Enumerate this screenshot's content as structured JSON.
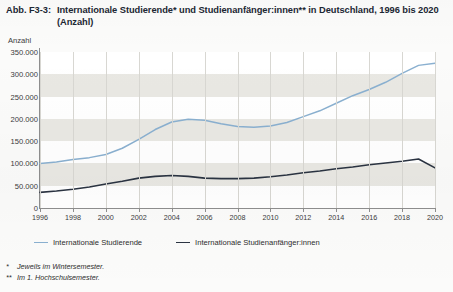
{
  "figure": {
    "number": "Abb. F3-3:",
    "title": "Internationale Studierende* und Studienanfänger:innen** in Deutschland, 1996 bis 2020 (Anzahl)"
  },
  "footnotes": [
    {
      "mark": "*",
      "text": "Jeweils im Wintersemester."
    },
    {
      "mark": "**",
      "text": "Im 1. Hochschulsemester."
    }
  ],
  "colors": {
    "series_studierende": "#8ab0d0",
    "series_anfaenger": "#2b3442",
    "band": "#e9e8e3",
    "grid": "#d8d7d2",
    "axis": "#8e8e8e",
    "title": "#1b2733"
  },
  "chart_data": {
    "type": "line",
    "title": "Internationale Studierende* und Studienanfänger:innen** in Deutschland, 1996 bis 2020 (Anzahl)",
    "xlabel": "",
    "ylabel": "Anzahl",
    "ylim": [
      0,
      350000
    ],
    "ytick_labels": [
      "0",
      "50.000",
      "100.000",
      "150.000",
      "200.000",
      "250.000",
      "300.000",
      "350.000"
    ],
    "ytick_values": [
      0,
      50000,
      100000,
      150000,
      200000,
      250000,
      300000,
      350000
    ],
    "xlim": [
      1996,
      2020
    ],
    "xtick_labels": [
      "1996",
      "1998",
      "2000",
      "2002",
      "2004",
      "2006",
      "2008",
      "2010",
      "2012",
      "2014",
      "2016",
      "2018",
      "2020"
    ],
    "xtick_values": [
      1996,
      1998,
      2000,
      2002,
      2004,
      2006,
      2008,
      2010,
      2012,
      2014,
      2016,
      2018,
      2020
    ],
    "x": [
      1996,
      1997,
      1998,
      1999,
      2000,
      2001,
      2002,
      2003,
      2004,
      2005,
      2006,
      2007,
      2008,
      2009,
      2010,
      2011,
      2012,
      2013,
      2014,
      2015,
      2016,
      2017,
      2018,
      2019,
      2020
    ],
    "grid": true,
    "legend_position": "below",
    "series": [
      {
        "name": "Internationale Studierende",
        "color": "#8ab0d0",
        "values": [
          100000,
          103000,
          109000,
          113000,
          120000,
          134000,
          154000,
          176000,
          193000,
          199000,
          197000,
          189000,
          183000,
          181000,
          184000,
          192000,
          205000,
          218000,
          235000,
          252000,
          266000,
          282000,
          302000,
          320000,
          325000
        ]
      },
      {
        "name": "Internationale Studienanfänger:innen",
        "color": "#2b3442",
        "values": [
          35000,
          38000,
          42000,
          47000,
          54000,
          60000,
          67000,
          71000,
          73000,
          71000,
          67000,
          66000,
          66000,
          67000,
          70000,
          74000,
          79000,
          83000,
          88000,
          92000,
          97000,
          101000,
          105000,
          110000,
          90000
        ]
      }
    ]
  }
}
